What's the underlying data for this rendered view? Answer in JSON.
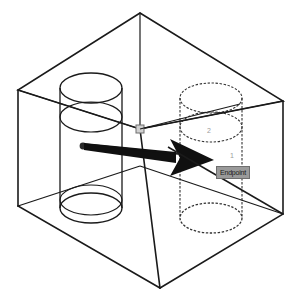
{
  "viewport": {
    "width": 301,
    "height": 303,
    "background": "#ffffff",
    "line_color": "#1a1a1a",
    "hidden_line_color": "#3a3a3a",
    "marker_color": "#7d7d7d",
    "label_color": "#9b9b9b"
  },
  "model": {
    "name": "isometric-block-with-four-holes",
    "description": "Isometric wireframe rectangular block containing four vertical through-holes",
    "hole_count": 4
  },
  "snap_tooltip": {
    "text": "Endpoint",
    "background": "#9a9a9a",
    "border": "#6e6e6e",
    "text_color": "#1a1a1a"
  },
  "markers": {
    "node_point_label": "node-point-marker",
    "endpoint_square_label": "endpoint-snap-square"
  },
  "labels": {
    "vertex_2": "2",
    "vertex_1": "1"
  },
  "arrow": {
    "label": "direction-arrow",
    "from_x": 83,
    "from_y": 146,
    "to_x": 213,
    "to_y": 160
  },
  "geometry": {
    "box_outline": {
      "top_vertex": [
        140,
        13
      ],
      "left_top_vertex": [
        18,
        90
      ],
      "right_top_vertex": [
        283,
        101
      ],
      "center_front_vertex": [
        140,
        129
      ],
      "left_bottom_vertex": [
        18,
        206
      ],
      "right_bottom_vertex": [
        283,
        214
      ],
      "bottom_vertex": [
        160,
        288
      ]
    },
    "holes": [
      {
        "id": "hole-back-left",
        "cx": 91,
        "cy_top": 88,
        "cy_bottom": 213,
        "rx": 31,
        "ry": 15,
        "style": "solid"
      },
      {
        "id": "hole-back-right",
        "cx": 211,
        "cy_top": 99,
        "cy_bottom": 220,
        "rx": 31,
        "ry": 15,
        "style": "dashed"
      },
      {
        "id": "hole-front-left",
        "cx": 91,
        "cy_top": 88,
        "cy_bottom": 213,
        "rx": 31,
        "ry": 15,
        "style": "solid"
      },
      {
        "id": "hole-front-right",
        "cx": 211,
        "cy_top": 99,
        "cy_bottom": 220,
        "rx": 31,
        "ry": 15,
        "style": "dashed"
      }
    ]
  }
}
